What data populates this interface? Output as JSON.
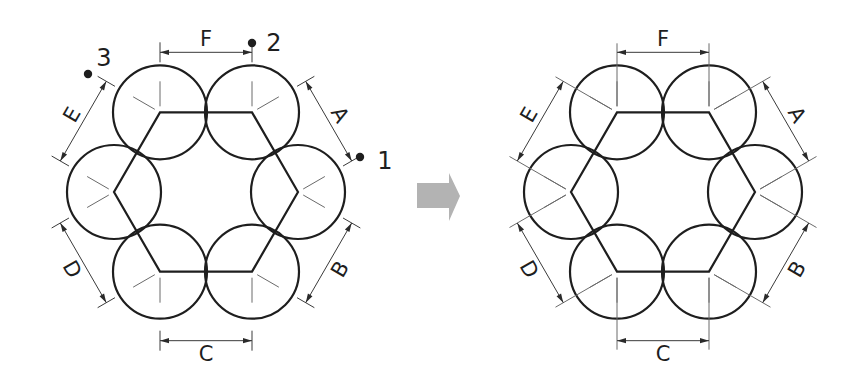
{
  "colors": {
    "stroke": "#1e1e1e",
    "thin_line": "#6a6a6a",
    "transition_arrow": "#b3b3b3",
    "background": "#ffffff"
  },
  "geometry": {
    "hex_radius": 92,
    "circle_radius": 47,
    "dimension_offset": 62
  },
  "left_diagram": {
    "label": "before",
    "center": [
      206,
      192
    ],
    "dimensions": [
      {
        "label": "A",
        "side": "upper-right"
      },
      {
        "label": "B",
        "side": "lower-right"
      },
      {
        "label": "C",
        "side": "bottom"
      },
      {
        "label": "D",
        "side": "lower-left"
      },
      {
        "label": "E",
        "side": "upper-left"
      },
      {
        "label": "F",
        "side": "top"
      }
    ],
    "points": [
      {
        "label": "1",
        "position": "end of dimension A"
      },
      {
        "label": "2",
        "position": "end of dimension F"
      },
      {
        "label": "3",
        "position": "end of dimension E"
      }
    ]
  },
  "transition_arrow": {
    "icon": "right-arrow-icon"
  },
  "right_diagram": {
    "label": "after",
    "center": [
      663,
      192
    ],
    "dimensions": [
      {
        "label": "A",
        "side": "upper-right"
      },
      {
        "label": "B",
        "side": "lower-right"
      },
      {
        "label": "C",
        "side": "bottom"
      },
      {
        "label": "D",
        "side": "lower-left"
      },
      {
        "label": "E",
        "side": "upper-left"
      },
      {
        "label": "F",
        "side": "top"
      }
    ]
  }
}
